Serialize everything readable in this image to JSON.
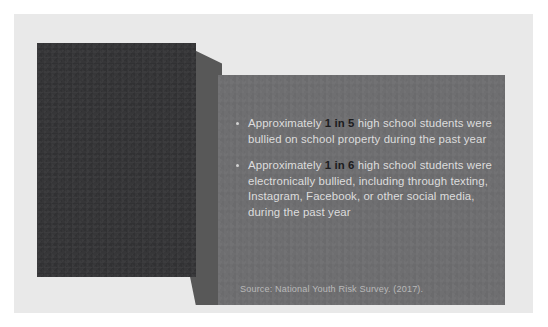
{
  "slide": {
    "background_color": "#e9e9e9",
    "canvas_color": "#ffffff"
  },
  "image_block": {
    "name": "photo-placeholder",
    "color": "#333335"
  },
  "content_panel": {
    "color": "#6e6e70",
    "accent_color": "#1c1c1e",
    "body_text_color": "#dddddd",
    "bullets": [
      {
        "lead": "Approximately ",
        "stat": "1 in 5",
        "tail": " high school students were bullied on school property during the past year"
      },
      {
        "lead": "Approximately ",
        "stat": "1 in 6",
        "tail": " high school students were electronically bullied, including through texting, Instagram, Facebook, or other social media, during the past year"
      }
    ],
    "source": "Source: National Youth Risk Survey. (2017)."
  }
}
